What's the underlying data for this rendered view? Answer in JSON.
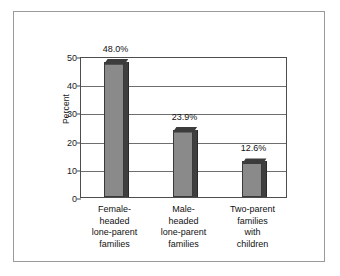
{
  "chart_data": {
    "type": "bar",
    "title": "",
    "subtitle": "",
    "xlabel": "",
    "ylabel": "Percent",
    "ylim": [
      0,
      50
    ],
    "yticks": [
      0,
      10,
      20,
      30,
      40,
      50
    ],
    "ytick_labels": [
      "0",
      "10",
      "20",
      "30",
      "40",
      "50"
    ],
    "grid": "horizontal",
    "legend": "none",
    "categories": [
      "Female-headed lone-parent families",
      "Male-headed lone-parent families",
      "Two-parent families with children"
    ],
    "category_lines": [
      [
        "Female-",
        "headed",
        "lone-parent",
        "families"
      ],
      [
        "Male-",
        "headed",
        "lone-parent",
        "families"
      ],
      [
        "Two-parent",
        "families",
        "with",
        "children"
      ]
    ],
    "values": [
      48.0,
      23.9,
      12.6
    ],
    "value_labels": [
      "48.0%",
      "23.9%",
      "12.6%"
    ],
    "colors": {
      "bar_front": "#8a8a8a",
      "bar_side": "#3f3f3f",
      "bar_top": "#464646",
      "axis": "#4d4d4d",
      "gridline": "#6e6e6e",
      "frame": "#9a9a9a",
      "text": "#111111",
      "background": "#ffffff"
    }
  }
}
